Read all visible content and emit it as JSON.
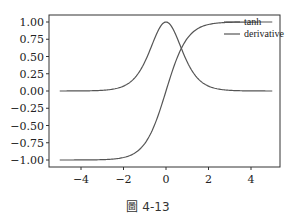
{
  "caption": "圖 4-13",
  "chart_data": {
    "type": "line",
    "title": "",
    "xlabel": "",
    "ylabel": "",
    "xlim": [
      -5.5,
      5.4
    ],
    "ylim": [
      -1.1,
      1.1
    ],
    "grid": false,
    "legend_position": "upper right",
    "x_ticks": [
      -4,
      -2,
      0,
      2,
      4
    ],
    "x_tick_labels": [
      "−4",
      "−2",
      "0",
      "2",
      "4"
    ],
    "y_ticks": [
      1.0,
      0.75,
      0.5,
      0.25,
      0.0,
      -0.25,
      -0.5,
      -0.75,
      -1.0
    ],
    "y_tick_labels": [
      "1.00",
      "0.75",
      "0.50",
      "0.25",
      "0.00",
      "−0.25",
      "−0.50",
      "−0.75",
      "−1.00"
    ],
    "x": [
      -5,
      -4,
      -3,
      -2,
      -1.5,
      -1,
      -0.5,
      0,
      0.5,
      1,
      1.5,
      2,
      3,
      4,
      5
    ],
    "series": [
      {
        "name": "tanh",
        "values": [
          -1.0,
          -0.999,
          -0.995,
          -0.964,
          -0.905,
          -0.762,
          -0.462,
          0.0,
          0.462,
          0.762,
          0.905,
          0.964,
          0.995,
          0.999,
          1.0
        ]
      },
      {
        "name": "derivative",
        "values": [
          0.0002,
          0.0013,
          0.0099,
          0.071,
          0.181,
          0.42,
          0.787,
          1.0,
          0.787,
          0.42,
          0.181,
          0.071,
          0.0099,
          0.0013,
          0.0002
        ]
      }
    ],
    "line_color": "#555555"
  }
}
